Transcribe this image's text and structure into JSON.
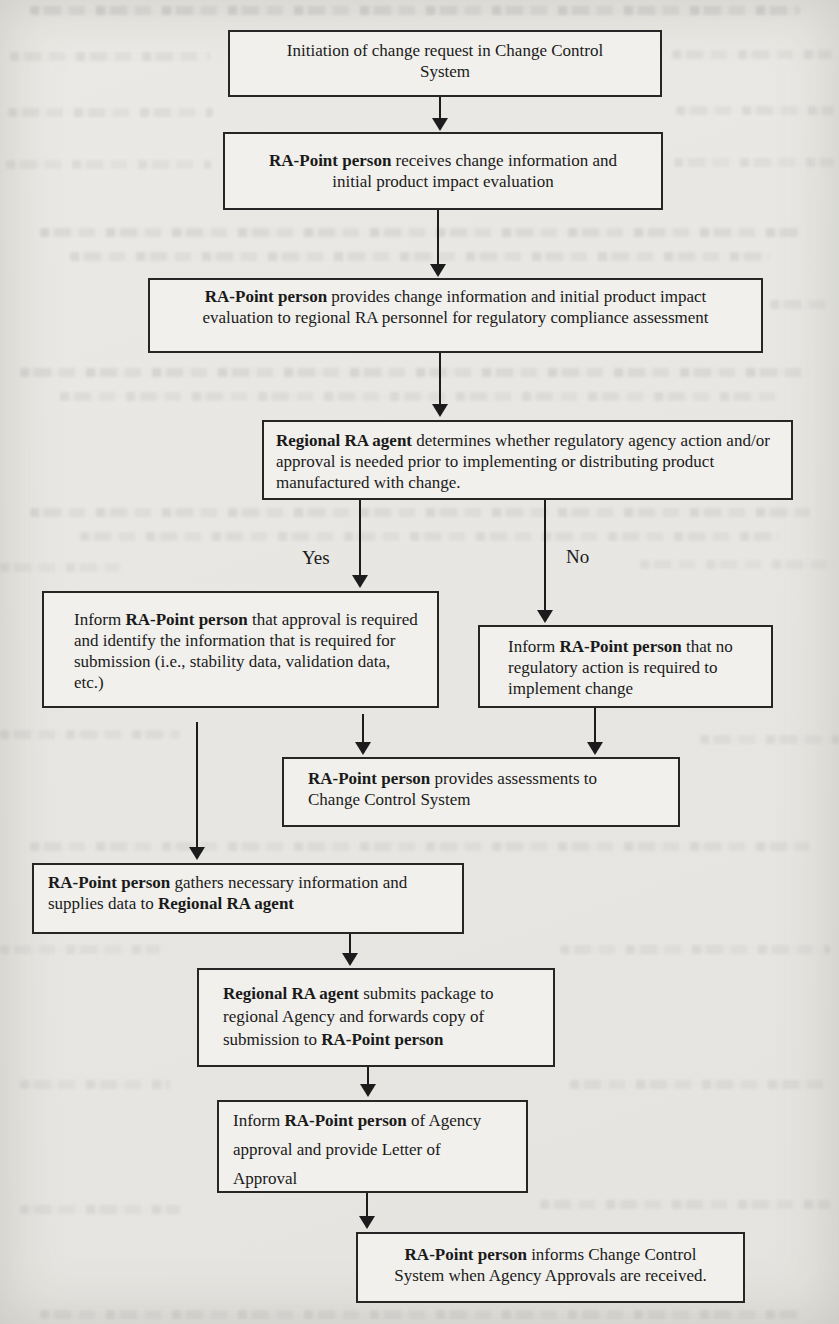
{
  "document": {
    "kind": "scanned flowchart page",
    "description": "Change control regulatory assessment flowchart"
  },
  "branch_labels": {
    "yes": "Yes",
    "no": "No"
  },
  "colors": {
    "ink": "#1a1a1a",
    "paper": "#e8e7e3",
    "box_fill": "#f1f0ec"
  },
  "nodes": {
    "initiation": {
      "segments": [
        {
          "text": "Initiation of change request in Change Control System",
          "bold": false
        }
      ]
    },
    "receives": {
      "segments": [
        {
          "text": "RA-Point person",
          "bold": true
        },
        {
          "text": " receives change information and initial product impact evaluation",
          "bold": false
        }
      ]
    },
    "provides_info": {
      "segments": [
        {
          "text": "RA-Point person",
          "bold": true
        },
        {
          "text": " provides change information and initial product impact evaluation to regional RA personnel for regulatory compliance assessment",
          "bold": false
        }
      ]
    },
    "determines": {
      "segments": [
        {
          "text": "Regional RA agent",
          "bold": true
        },
        {
          "text": " determines whether regulatory agency action and/or approval is needed prior to implementing or distributing product manufactured with change.",
          "bold": false
        }
      ]
    },
    "inform_approval_required": {
      "segments": [
        {
          "text": "Inform ",
          "bold": false
        },
        {
          "text": "RA-Point person",
          "bold": true
        },
        {
          "text": " that approval is required and identify the information that is required for submission (i.e., stability data, validation data, etc.)",
          "bold": false
        }
      ]
    },
    "inform_no_action": {
      "segments": [
        {
          "text": "Inform ",
          "bold": false
        },
        {
          "text": "RA-Point person",
          "bold": true
        },
        {
          "text": " that no regulatory action is required to implement change",
          "bold": false
        }
      ]
    },
    "provides_assessments": {
      "segments": [
        {
          "text": "RA-Point person",
          "bold": true
        },
        {
          "text": " provides assessments to Change Control System",
          "bold": false
        }
      ]
    },
    "gathers": {
      "segments": [
        {
          "text": "RA-Point person",
          "bold": true
        },
        {
          "text": " gathers necessary information and supplies data to ",
          "bold": false
        },
        {
          "text": "Regional RA agent",
          "bold": true
        }
      ]
    },
    "submits": {
      "segments": [
        {
          "text": "Regional RA agent",
          "bold": true
        },
        {
          "text": " submits package to regional Agency and forwards copy of submission to ",
          "bold": false
        },
        {
          "text": "RA-Point person",
          "bold": true
        }
      ]
    },
    "inform_agency_approval": {
      "segments": [
        {
          "text": "Inform ",
          "bold": false
        },
        {
          "text": "RA-Point person",
          "bold": true
        },
        {
          "text": " of Agency approval and provide Letter of Approval",
          "bold": false
        }
      ]
    },
    "informs_ccs": {
      "segments": [
        {
          "text": "RA-Point person",
          "bold": true
        },
        {
          "text": " informs Change Control System when Agency Approvals are received.",
          "bold": false
        }
      ]
    }
  }
}
